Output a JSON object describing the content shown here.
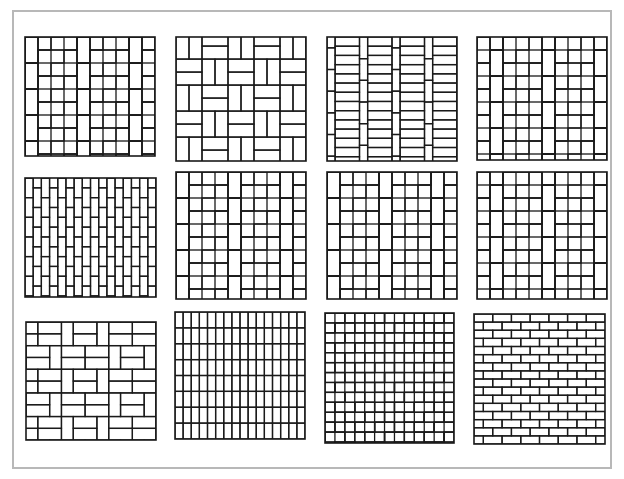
{
  "figure": {
    "title": "",
    "stroke_color": "#1a1a1a",
    "frame_color": "#b8b8b8",
    "background": "#ffffff"
  },
  "patterns": [
    {
      "id": "p1",
      "name": "basket-weave-offset",
      "x": 24,
      "y": 36,
      "w": 130,
      "h": 119,
      "type": "pinwheel-a"
    },
    {
      "id": "p2",
      "name": "basket-weave-with-half-bricks",
      "x": 175,
      "y": 36,
      "w": 130,
      "h": 124,
      "type": "basket-stack"
    },
    {
      "id": "p3",
      "name": "running-bond-with-soldier-columns",
      "x": 326,
      "y": 36,
      "w": 130,
      "h": 124,
      "type": "soldier-columns"
    },
    {
      "id": "p4",
      "name": "basket-weave-staggered",
      "x": 476,
      "y": 36,
      "w": 130,
      "h": 123,
      "type": "pinwheel-b"
    },
    {
      "id": "p5",
      "name": "vertical-running-bond",
      "x": 24,
      "y": 177,
      "w": 131,
      "h": 119,
      "type": "vertical-running"
    },
    {
      "id": "p6",
      "name": "herringbone-basket-a",
      "x": 175,
      "y": 171,
      "w": 130,
      "h": 127,
      "type": "pinwheel-c"
    },
    {
      "id": "p7",
      "name": "herringbone-basket-b",
      "x": 326,
      "y": 171,
      "w": 130,
      "h": 127,
      "type": "pinwheel-c"
    },
    {
      "id": "p8",
      "name": "herringbone-basket-c",
      "x": 476,
      "y": 171,
      "w": 130,
      "h": 127,
      "type": "pinwheel-d"
    },
    {
      "id": "p9",
      "name": "double-basket-weave",
      "x": 25,
      "y": 321,
      "w": 130,
      "h": 118,
      "type": "double-basket"
    },
    {
      "id": "p10",
      "name": "stack-bond-vertical",
      "x": 174,
      "y": 311,
      "w": 130,
      "h": 127,
      "type": "stack-vertical"
    },
    {
      "id": "p11",
      "name": "herringbone-45",
      "x": 324,
      "y": 312,
      "w": 129,
      "h": 130,
      "type": "herringbone"
    },
    {
      "id": "p12",
      "name": "running-bond-horizontal",
      "x": 473,
      "y": 313,
      "w": 131,
      "h": 130,
      "type": "running-horizontal"
    }
  ]
}
